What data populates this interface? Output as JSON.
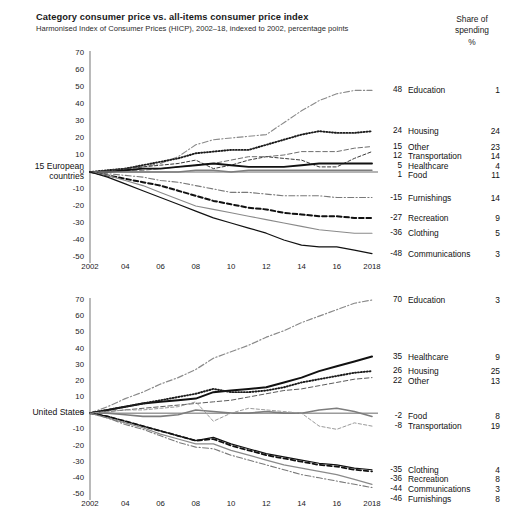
{
  "header": {
    "title": "Category consumer price vs. all-items consumer price index",
    "subtitle": "Harmonised Index of Consumer Prices (HICP), 2002–18, indexed to 2002, percentage points",
    "share_header_line1": "Share of",
    "share_header_line2": "spending",
    "share_header_line3": "%"
  },
  "panels": {
    "top": {
      "label_line1": "15 European",
      "label_line2": "countries"
    },
    "bottom": {
      "label_line1": "United States",
      "label_line2": ""
    }
  },
  "axis": {
    "yticks": [
      "70",
      "60",
      "50",
      "40",
      "30",
      "20",
      "10",
      "0",
      "-10",
      "-20",
      "-30",
      "-40",
      "-50"
    ],
    "xticks": [
      "2002",
      "04",
      "06",
      "08",
      "10",
      "12",
      "14",
      "16",
      "2018"
    ]
  },
  "chart_data": [
    {
      "type": "line",
      "title": "15 European countries",
      "xlabel": "",
      "ylabel": "percentage points",
      "xlim": [
        2002,
        2018
      ],
      "ylim": [
        -50,
        70
      ],
      "grid": false,
      "legend": "right-endpoint labels",
      "x": [
        2002,
        2003,
        2004,
        2005,
        2006,
        2007,
        2008,
        2009,
        2010,
        2011,
        2012,
        2013,
        2014,
        2015,
        2016,
        2017,
        2018
      ],
      "series": [
        {
          "name": "Education",
          "end_value": 48,
          "share": 1,
          "style": "dashdot",
          "color": "#8a8a8a",
          "width": 1.1,
          "values": [
            0,
            1,
            2,
            3,
            5,
            9,
            16,
            19,
            20,
            21,
            22,
            29,
            36,
            42,
            46,
            48,
            48
          ]
        },
        {
          "name": "Housing",
          "end_value": 24,
          "share": 24,
          "style": "dotted",
          "color": "#1c1c1c",
          "width": 1.9,
          "values": [
            0,
            1,
            2,
            4,
            6,
            8,
            11,
            12,
            13,
            13,
            16,
            19,
            22,
            24,
            23,
            23,
            24
          ]
        },
        {
          "name": "Other",
          "end_value": 15,
          "share": 23,
          "style": "dashed",
          "color": "#6e6e6e",
          "width": 1.0,
          "values": [
            0,
            0,
            1,
            1,
            2,
            3,
            4,
            5,
            7,
            9,
            9,
            10,
            12,
            12,
            12,
            14,
            15
          ]
        },
        {
          "name": "Transportation",
          "end_value": 12,
          "share": 14,
          "style": "dashed-fine",
          "color": "#3a3a3a",
          "width": 1.0,
          "values": [
            0,
            1,
            2,
            3,
            4,
            5,
            7,
            2,
            4,
            7,
            9,
            8,
            7,
            3,
            3,
            8,
            12
          ]
        },
        {
          "name": "Healthcare",
          "end_value": 5,
          "share": 4,
          "style": "solid",
          "color": "#111111",
          "width": 1.9,
          "values": [
            0,
            0,
            1,
            2,
            2,
            3,
            4,
            5,
            4,
            3,
            3,
            3,
            4,
            5,
            5,
            5,
            5
          ]
        },
        {
          "name": "Food",
          "end_value": 1,
          "share": 11,
          "style": "solid-gray",
          "color": "#7d7d7d",
          "width": 1.4,
          "values": [
            0,
            0,
            0,
            0,
            0,
            0,
            1,
            1,
            0,
            1,
            1,
            1,
            1,
            1,
            1,
            1,
            1
          ]
        },
        {
          "name": "Furnishings",
          "end_value": -15,
          "share": 14,
          "style": "dashdot",
          "color": "#7a7a7a",
          "width": 1.1,
          "values": [
            0,
            -1,
            -2,
            -3,
            -5,
            -6,
            -8,
            -10,
            -12,
            -12,
            -13,
            -14,
            -14,
            -14,
            -15,
            -15,
            -15
          ]
        },
        {
          "name": "Recreation",
          "end_value": -27,
          "share": 9,
          "style": "dashed-bold",
          "color": "#111111",
          "width": 2.0,
          "values": [
            0,
            -2,
            -4,
            -6,
            -8,
            -11,
            -14,
            -17,
            -19,
            -21,
            -22,
            -24,
            -25,
            -26,
            -26,
            -27,
            -27
          ]
        },
        {
          "name": "Clothing",
          "end_value": -36,
          "share": 5,
          "style": "solid-gray",
          "color": "#8a8a8a",
          "width": 1.1,
          "values": [
            0,
            -2,
            -5,
            -8,
            -12,
            -16,
            -20,
            -22,
            -24,
            -26,
            -28,
            -30,
            -32,
            -34,
            -35,
            -36,
            -36
          ]
        },
        {
          "name": "Communications",
          "end_value": -48,
          "share": 3,
          "style": "solid",
          "color": "#111111",
          "width": 1.2,
          "values": [
            0,
            -3,
            -7,
            -11,
            -15,
            -19,
            -23,
            -27,
            -30,
            -33,
            -36,
            -40,
            -43,
            -44,
            -44,
            -46,
            -48
          ]
        }
      ]
    },
    {
      "type": "line",
      "title": "United States",
      "xlabel": "",
      "ylabel": "percentage points",
      "xlim": [
        2002,
        2018
      ],
      "ylim": [
        -50,
        70
      ],
      "grid": false,
      "legend": "right-endpoint labels",
      "x": [
        2002,
        2003,
        2004,
        2005,
        2006,
        2007,
        2008,
        2009,
        2010,
        2011,
        2012,
        2013,
        2014,
        2015,
        2016,
        2017,
        2018
      ],
      "series": [
        {
          "name": "Education",
          "end_value": 70,
          "share": 3,
          "style": "dashdot",
          "color": "#8a8a8a",
          "width": 1.2,
          "values": [
            0,
            4,
            9,
            13,
            18,
            22,
            27,
            34,
            38,
            42,
            47,
            51,
            56,
            60,
            64,
            68,
            70
          ]
        },
        {
          "name": "Healthcare",
          "end_value": 35,
          "share": 9,
          "style": "solid",
          "color": "#111111",
          "width": 2.0,
          "values": [
            0,
            2,
            4,
            6,
            7,
            8,
            9,
            13,
            14,
            15,
            16,
            19,
            22,
            26,
            29,
            32,
            35
          ]
        },
        {
          "name": "Housing",
          "end_value": 26,
          "share": 25,
          "style": "dotted",
          "color": "#1c1c1c",
          "width": 1.9,
          "values": [
            0,
            2,
            4,
            6,
            8,
            10,
            12,
            15,
            13,
            13,
            14,
            16,
            19,
            21,
            23,
            25,
            26
          ]
        },
        {
          "name": "Other",
          "end_value": 22,
          "share": 13,
          "style": "dashed",
          "color": "#5c5c5c",
          "width": 1.0,
          "values": [
            0,
            1,
            2,
            3,
            4,
            5,
            6,
            7,
            8,
            10,
            12,
            14,
            15,
            17,
            19,
            21,
            22
          ]
        },
        {
          "name": "Food",
          "end_value": -2,
          "share": 8,
          "style": "solid-gray",
          "color": "#7d7d7d",
          "width": 1.6,
          "values": [
            0,
            0,
            -1,
            -2,
            -2,
            -1,
            2,
            1,
            0,
            0,
            1,
            0,
            0,
            2,
            3,
            1,
            -2
          ]
        },
        {
          "name": "Transportation",
          "end_value": -8,
          "share": 19,
          "style": "dashed-fine",
          "color": "#9a9a9a",
          "width": 1.0,
          "values": [
            0,
            1,
            2,
            2,
            3,
            4,
            7,
            -5,
            0,
            3,
            2,
            1,
            0,
            -8,
            -10,
            -6,
            -8
          ]
        },
        {
          "name": "Clothing",
          "end_value": -35,
          "share": 4,
          "style": "solid",
          "color": "#111111",
          "width": 1.2,
          "values": [
            0,
            -2,
            -5,
            -8,
            -11,
            -14,
            -17,
            -15,
            -19,
            -22,
            -25,
            -27,
            -29,
            -31,
            -32,
            -34,
            -35
          ]
        },
        {
          "name": "Recreation",
          "end_value": -36,
          "share": 8,
          "style": "dashed-bold",
          "color": "#111111",
          "width": 1.8,
          "values": [
            0,
            -2,
            -5,
            -8,
            -11,
            -14,
            -17,
            -16,
            -20,
            -23,
            -26,
            -28,
            -30,
            -32,
            -33,
            -35,
            -36
          ]
        },
        {
          "name": "Communications",
          "end_value": -44,
          "share": 3,
          "style": "solid-gray",
          "color": "#8a8a8a",
          "width": 1.2,
          "values": [
            0,
            -3,
            -6,
            -9,
            -13,
            -16,
            -19,
            -19,
            -23,
            -26,
            -29,
            -32,
            -34,
            -36,
            -38,
            -41,
            -44
          ]
        },
        {
          "name": "Furnishings",
          "end_value": -46,
          "share": 8,
          "style": "dashdot",
          "color": "#7a7a7a",
          "width": 1.1,
          "values": [
            0,
            -3,
            -7,
            -10,
            -14,
            -18,
            -21,
            -22,
            -26,
            -29,
            -32,
            -35,
            -38,
            -40,
            -42,
            -44,
            -46
          ]
        }
      ]
    }
  ]
}
